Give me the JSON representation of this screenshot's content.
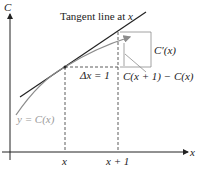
{
  "diagram": {
    "axes": {
      "y_label": "C",
      "x_label": "x"
    },
    "title_label": "Tangent line at x",
    "tangent_label_prefix": "Tangent line at ",
    "tangent_label_var": "x",
    "delta_label": "Δx = 1",
    "derivative_label": "C′(x)",
    "difference_label": "C(x + 1) − C(x)",
    "curve_label": "y = C(x)",
    "x_ticks": [
      "x",
      "x + 1"
    ],
    "colors": {
      "axis": "#222222",
      "tangent": "#222222",
      "curve": "#8c8c8c",
      "dashed": "#333333"
    }
  }
}
